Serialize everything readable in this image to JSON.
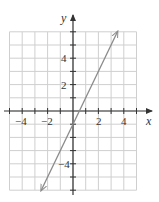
{
  "chart_data": {
    "type": "line",
    "title": "",
    "xlabel": "x",
    "ylabel": "y",
    "xlim": [
      -5,
      5
    ],
    "ylim": [
      -6,
      6
    ],
    "grid": true,
    "x_tick_labels": [
      "-4",
      "-2",
      "2",
      "4"
    ],
    "x_ticks": [
      -4,
      -2,
      2,
      4
    ],
    "y_tick_labels": [
      "4",
      "2",
      "-4"
    ],
    "y_ticks": [
      4,
      2,
      -4
    ],
    "series": [
      {
        "name": "y = 2x - 1",
        "equation": "y = 2x - 1",
        "x": [
          -2.5,
          3.5
        ],
        "y": [
          -6,
          6
        ],
        "arrows": "both",
        "color": "#888888"
      }
    ]
  },
  "labels": {
    "x_axis": "x",
    "y_axis": "y",
    "xt_m4": "−4",
    "xt_m2": "−2",
    "xt_2": "2",
    "xt_4": "4",
    "yt_4": "4",
    "yt_2": "2",
    "yt_m4": "−4"
  },
  "colors": {
    "grid": "#cfcfcf",
    "axis": "#333333",
    "line": "#8a8a8a"
  }
}
